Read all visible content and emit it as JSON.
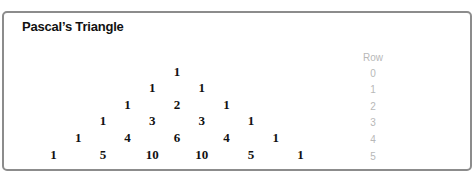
{
  "title": "Pascal’s Triangle",
  "row_header": "Row",
  "rows": [
    {
      "label": "0",
      "values": [
        "1"
      ]
    },
    {
      "label": "1",
      "values": [
        "1",
        "1"
      ]
    },
    {
      "label": "2",
      "values": [
        "1",
        "2",
        "1"
      ]
    },
    {
      "label": "3",
      "values": [
        "1",
        "3",
        "3",
        "1"
      ]
    },
    {
      "label": "4",
      "values": [
        "1",
        "4",
        "6",
        "4",
        "1"
      ]
    },
    {
      "label": "5",
      "values": [
        "1",
        "5",
        "10",
        "10",
        "5",
        "1"
      ]
    }
  ],
  "colors": {
    "border": "#8c8c8c",
    "numbers": "#111111",
    "row_labels": "#b8b8b8"
  }
}
